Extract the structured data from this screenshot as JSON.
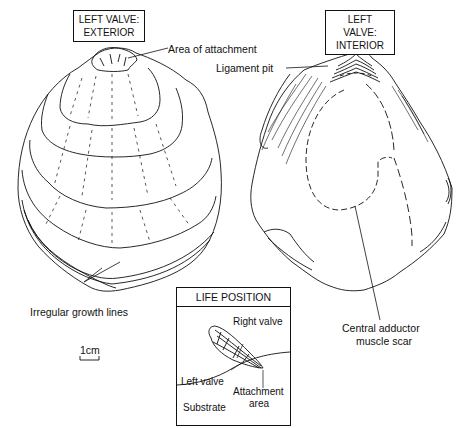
{
  "figure": {
    "panels": [
      {
        "id": "exterior",
        "title_line1": "LEFT VALVE:",
        "title_line2": "EXTERIOR"
      },
      {
        "id": "interior",
        "title_line1": "LEFT VALVE:",
        "title_line2": "INTERIOR"
      }
    ],
    "labels": {
      "area_of_attachment": "Area of attachment",
      "ligament_pit": "Ligament pit",
      "irregular_growth_lines": "Irregular growth lines",
      "scale_bar": "1cm",
      "central_adductor_line1": "Central adductor",
      "central_adductor_line2": "muscle scar"
    },
    "life_position": {
      "title": "LIFE POSITION",
      "right_valve": "Right valve",
      "left_valve": "Left valve",
      "attachment_line1": "Attachment",
      "attachment_line2": "area",
      "substrate": "Substrate"
    },
    "colors": {
      "ink": "#111111",
      "background": "#ffffff"
    }
  }
}
